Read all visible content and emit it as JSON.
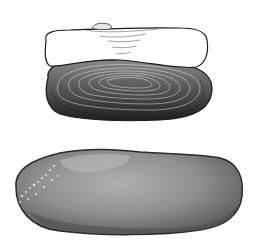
{
  "image": {
    "description": "Two illustrations of an elongated freshwater mussel shell: a line-engraved drawing (top) and a grey photographic view (bottom)",
    "colors": {
      "background": "#ffffff",
      "engraving_dark": "#1e1e1e",
      "engraving_mid": "#6a6a6a",
      "photo_shell": "#8c8c8c",
      "photo_highlight": "#bdbdbd",
      "photo_edge": "#2a2a2a"
    }
  }
}
